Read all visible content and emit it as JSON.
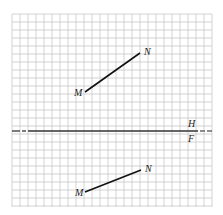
{
  "diagram": {
    "type": "orthographic-projection",
    "grid": {
      "x0": 12,
      "y0": 14,
      "x1": 212,
      "y1": 207,
      "spacing": 8,
      "color": "#c8c8c8"
    },
    "fold_line": {
      "y": 131,
      "upper_label": "H",
      "lower_label": "F",
      "color": "#333333"
    },
    "views": [
      {
        "name": "horizontal-view",
        "segment": {
          "start": {
            "label": "M",
            "x": 85,
            "y": 92
          },
          "end": {
            "label": "N",
            "x": 140,
            "y": 53
          }
        }
      },
      {
        "name": "frontal-view",
        "segment": {
          "start": {
            "label": "M",
            "x": 85,
            "y": 192
          },
          "end": {
            "label": "N",
            "x": 141,
            "y": 170
          }
        }
      }
    ]
  }
}
